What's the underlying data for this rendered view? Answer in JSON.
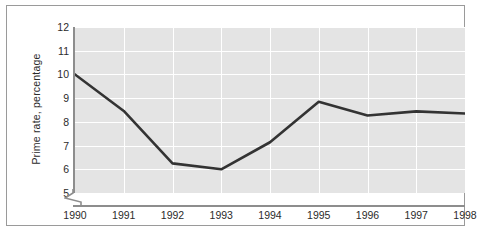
{
  "chart_data": {
    "type": "line",
    "title": "",
    "subtitle": "",
    "xlabel": "",
    "ylabel": "Prime rate, percentage",
    "categories": [
      "1990",
      "1991",
      "1992",
      "1993",
      "1994",
      "1995",
      "1996",
      "1997",
      "1998"
    ],
    "x": [
      1990,
      1991,
      1992,
      1993,
      1994,
      1995,
      1996,
      1997,
      1998
    ],
    "values": [
      10.0,
      8.46,
      6.25,
      6.0,
      7.14,
      8.85,
      8.27,
      8.44,
      8.35
    ],
    "series": [
      {
        "name": "Prime rate",
        "values": [
          10.0,
          8.46,
          6.25,
          6.0,
          7.14,
          8.85,
          8.27,
          8.44,
          8.35
        ]
      }
    ],
    "ylim": [
      5,
      12
    ],
    "xlim": [
      1990,
      1998
    ],
    "yticks": [
      5,
      6,
      7,
      8,
      9,
      10,
      11,
      12
    ],
    "ytick_labels": [
      "5",
      "6",
      "7",
      "8",
      "9",
      "10",
      "11",
      "12"
    ],
    "xtick_labels": [
      "1990",
      "1991",
      "1992",
      "1993",
      "1994",
      "1995",
      "1996",
      "1997",
      "1998"
    ],
    "grid": true,
    "grid_color": "#ffffff",
    "legend": false,
    "legend_position": "none",
    "y_axis_break": true,
    "plot_background": "#e4e4e4",
    "line_color": "#333333",
    "axis_color": "#8d8d8d",
    "text_color": "#2b2b2b",
    "frame_color": "#9a9a9a",
    "annotations": []
  }
}
